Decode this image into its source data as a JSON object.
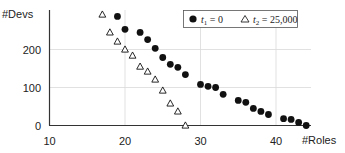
{
  "chart_data": {
    "type": "scatter",
    "title": "",
    "xlabel": "#Roles",
    "ylabel": "#Devs",
    "xlim": [
      10,
      45
    ],
    "ylim": [
      0,
      300
    ],
    "x_ticks": [
      10,
      20,
      30,
      40
    ],
    "y_ticks": [
      0,
      100,
      200
    ],
    "grid": {
      "x": true,
      "y": true
    },
    "legend_position": "top-right",
    "series": [
      {
        "name": "t1 = 0",
        "marker": "filled-circle",
        "color": "#111111",
        "points": [
          [
            19,
            287
          ],
          [
            20,
            253
          ],
          [
            22,
            245
          ],
          [
            23,
            226
          ],
          [
            24,
            203
          ],
          [
            25,
            179
          ],
          [
            26,
            161
          ],
          [
            27,
            153
          ],
          [
            28,
            134
          ],
          [
            30,
            108
          ],
          [
            31,
            103
          ],
          [
            32,
            100
          ],
          [
            33,
            82
          ],
          [
            35,
            66
          ],
          [
            36,
            61
          ],
          [
            37,
            45
          ],
          [
            38,
            37
          ],
          [
            39,
            29
          ],
          [
            41,
            18
          ],
          [
            42,
            16
          ],
          [
            43,
            8
          ],
          [
            44,
            0
          ]
        ]
      },
      {
        "name": "t2 = 25,000",
        "marker": "open-triangle",
        "color": "#111111",
        "points": [
          [
            17,
            292
          ],
          [
            18,
            245
          ],
          [
            19,
            221
          ],
          [
            20,
            200
          ],
          [
            21,
            184
          ],
          [
            22,
            155
          ],
          [
            23,
            142
          ],
          [
            24,
            121
          ],
          [
            25,
            92
          ],
          [
            26,
            58
          ],
          [
            27,
            37
          ],
          [
            28,
            0
          ]
        ]
      }
    ]
  },
  "legend": {
    "item1": {
      "var": "t",
      "sub": "1",
      "rest": " = 0"
    },
    "item2": {
      "var": "t",
      "sub": "2",
      "rest": " = 25,000"
    }
  },
  "axes": {
    "ylabel": "#Devs",
    "xlabel": "#Roles",
    "y_tick_labels": [
      "0",
      "100",
      "200"
    ],
    "x_tick_labels": [
      "10",
      "20",
      "30",
      "40"
    ]
  }
}
